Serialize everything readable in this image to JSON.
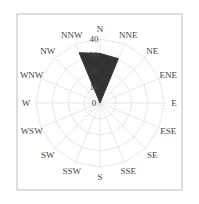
{
  "chart_data": {
    "type": "radar",
    "title": "",
    "directions": [
      "N",
      "NNE",
      "NE",
      "ENE",
      "E",
      "ESE",
      "SE",
      "SSE",
      "S",
      "SSW",
      "SW",
      "WSW",
      "W",
      "WNW",
      "NW",
      "NNW"
    ],
    "series": [
      {
        "name": "frequency",
        "values": [
          31,
          30,
          0,
          0,
          0,
          0,
          0,
          0,
          0,
          0,
          0,
          0,
          0,
          0,
          0,
          34
        ],
        "color": "#333333"
      }
    ],
    "radial_ticks": [
      "0",
      "10",
      "20",
      "30",
      "40"
    ],
    "rlim": [
      0,
      40
    ],
    "grid": true
  }
}
